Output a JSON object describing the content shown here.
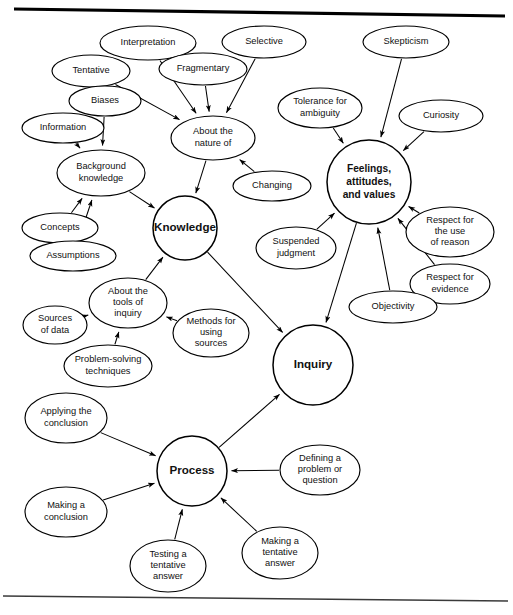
{
  "figure": {
    "kind": "concept-map",
    "title_visible": "",
    "background_color": "#ffffff",
    "line_color": "#000000",
    "text_color": "#111111",
    "width": 513,
    "height": 615,
    "rules": [
      {
        "name": "top-rule",
        "x1": 14,
        "y1": 9,
        "x2": 505,
        "y2": 16,
        "weight": 3.2
      },
      {
        "name": "bottom-rule",
        "x1": 3,
        "y1": 596,
        "x2": 508,
        "y2": 601,
        "weight": 1.3
      }
    ]
  },
  "hubs": [
    {
      "id": "knowledge",
      "label": "Knowledge",
      "cx": 185,
      "cy": 228,
      "r": 32,
      "lines": [
        "Knowledge"
      ]
    },
    {
      "id": "feelings",
      "label": "Feelings, attitudes, and values",
      "cx": 369,
      "cy": 182,
      "r": 42,
      "lines": [
        "Feelings,",
        "attitudes,",
        "and values"
      ]
    },
    {
      "id": "inquiry",
      "label": "Inquiry",
      "cx": 313,
      "cy": 365,
      "r": 40,
      "lines": [
        "Inquiry"
      ]
    },
    {
      "id": "process",
      "label": "Process",
      "cx": 192,
      "cy": 471,
      "r": 35,
      "lines": [
        "Process"
      ]
    }
  ],
  "nodes": [
    {
      "id": "interpretation",
      "label": "Interpretation",
      "cx": 148,
      "cy": 43,
      "rx": 48,
      "ry": 17,
      "lines": [
        "Interpretation"
      ]
    },
    {
      "id": "selective",
      "label": "Selective",
      "cx": 264,
      "cy": 42,
      "rx": 42,
      "ry": 16,
      "lines": [
        "Selective"
      ]
    },
    {
      "id": "skepticism",
      "label": "Skepticism",
      "cx": 406,
      "cy": 42,
      "rx": 43,
      "ry": 16,
      "lines": [
        "Skepticism"
      ]
    },
    {
      "id": "fragmentary",
      "label": "Fragmentary",
      "cx": 203,
      "cy": 69,
      "rx": 44,
      "ry": 16,
      "lines": [
        "Fragmentary"
      ]
    },
    {
      "id": "tentative",
      "label": "Tentative",
      "cx": 91,
      "cy": 71,
      "rx": 39,
      "ry": 16,
      "lines": [
        "Tentative"
      ]
    },
    {
      "id": "tolerance-ambiguity",
      "label": "Tolerance for ambiguity",
      "cx": 320,
      "cy": 108,
      "rx": 42,
      "ry": 20,
      "lines": [
        "Tolerance for",
        "ambiguity"
      ]
    },
    {
      "id": "curiosity",
      "label": "Curiosity",
      "cx": 441,
      "cy": 116,
      "rx": 42,
      "ry": 16,
      "lines": [
        "Curiosity"
      ]
    },
    {
      "id": "biases",
      "label": "Biases",
      "cx": 105,
      "cy": 101,
      "rx": 36,
      "ry": 15,
      "lines": [
        "Biases"
      ]
    },
    {
      "id": "information",
      "label": "Information",
      "cx": 63,
      "cy": 128,
      "rx": 41,
      "ry": 15,
      "lines": [
        "Information"
      ]
    },
    {
      "id": "about-nature-of",
      "label": "About the nature of",
      "cx": 213,
      "cy": 138,
      "rx": 42,
      "ry": 22,
      "lines": [
        "About the",
        "nature of"
      ]
    },
    {
      "id": "background-knowledge",
      "label": "Background knowledge",
      "cx": 101,
      "cy": 173,
      "rx": 44,
      "ry": 23,
      "lines": [
        "Background",
        "knowledge"
      ]
    },
    {
      "id": "changing",
      "label": "Changing",
      "cx": 272,
      "cy": 186,
      "rx": 39,
      "ry": 15,
      "lines": [
        "Changing"
      ]
    },
    {
      "id": "concepts",
      "label": "Concepts",
      "cx": 60,
      "cy": 228,
      "rx": 38,
      "ry": 15,
      "lines": [
        "Concepts"
      ]
    },
    {
      "id": "assumptions",
      "label": "Assumptions",
      "cx": 73,
      "cy": 256,
      "rx": 43,
      "ry": 15,
      "lines": [
        "Assumptions"
      ]
    },
    {
      "id": "suspended-judgment",
      "label": "Suspended judgment",
      "cx": 296,
      "cy": 248,
      "rx": 40,
      "ry": 21,
      "lines": [
        "Suspended",
        "judgment"
      ]
    },
    {
      "id": "respect-reason",
      "label": "Respect for the use of reason",
      "cx": 450,
      "cy": 232,
      "rx": 44,
      "ry": 25,
      "lines": [
        "Respect for",
        "the use",
        "of reason"
      ]
    },
    {
      "id": "respect-evidence",
      "label": "Respect for evidence",
      "cx": 450,
      "cy": 284,
      "rx": 40,
      "ry": 20,
      "lines": [
        "Respect for",
        "evidence"
      ]
    },
    {
      "id": "objectivity",
      "label": "Objectivity",
      "cx": 393,
      "cy": 307,
      "rx": 44,
      "ry": 16,
      "lines": [
        "Objectivity"
      ]
    },
    {
      "id": "about-tools-inquiry",
      "label": "About the tools of inquiry",
      "cx": 128,
      "cy": 303,
      "rx": 39,
      "ry": 25,
      "lines": [
        "About the",
        "tools of",
        "inquiry"
      ]
    },
    {
      "id": "sources-of-data",
      "label": "Sources of data",
      "cx": 55,
      "cy": 325,
      "rx": 32,
      "ry": 19,
      "lines": [
        "Sources",
        "of data"
      ]
    },
    {
      "id": "methods-using-sources",
      "label": "Methods for using sources",
      "cx": 211,
      "cy": 333,
      "rx": 38,
      "ry": 24,
      "lines": [
        "Methods for",
        "using",
        "sources"
      ]
    },
    {
      "id": "problem-solving",
      "label": "Problem-solving techniques",
      "cx": 108,
      "cy": 366,
      "rx": 44,
      "ry": 21,
      "lines": [
        "Problem-solving",
        "techniques"
      ]
    },
    {
      "id": "applying-conclusion",
      "label": "Applying the conclusion",
      "cx": 66,
      "cy": 418,
      "rx": 41,
      "ry": 25,
      "lines": [
        "Applying the",
        "conclusion"
      ]
    },
    {
      "id": "defining-problem",
      "label": "Defining a problem or question",
      "cx": 320,
      "cy": 470,
      "rx": 40,
      "ry": 25,
      "lines": [
        "Defining a",
        "problem or",
        "question"
      ]
    },
    {
      "id": "making-conclusion",
      "label": "Making a conclusion",
      "cx": 66,
      "cy": 512,
      "rx": 41,
      "ry": 25,
      "lines": [
        "Making a",
        "conclusion"
      ]
    },
    {
      "id": "testing-tentative-answer",
      "label": "Testing a tentative answer",
      "cx": 168,
      "cy": 566,
      "rx": 38,
      "ry": 26,
      "lines": [
        "Testing a",
        "tentative",
        "answer"
      ]
    },
    {
      "id": "making-tentative-answer",
      "label": "Making a tentative answer",
      "cx": 280,
      "cy": 553,
      "rx": 38,
      "ry": 26,
      "lines": [
        "Making a",
        "tentative",
        "answer"
      ]
    }
  ],
  "edges": [
    {
      "from": "interpretation",
      "to": "about-nature-of",
      "arrow": true
    },
    {
      "from": "selective",
      "to": "about-nature-of",
      "arrow": true
    },
    {
      "from": "fragmentary",
      "to": "about-nature-of",
      "arrow": true
    },
    {
      "from": "tentative",
      "to": "about-nature-of",
      "arrow": true
    },
    {
      "from": "changing",
      "to": "about-nature-of",
      "arrow": true
    },
    {
      "from": "about-nature-of",
      "to": "knowledge",
      "arrow": true
    },
    {
      "from": "biases",
      "to": "background-knowledge",
      "arrow": true
    },
    {
      "from": "information",
      "to": "background-knowledge",
      "arrow": true
    },
    {
      "from": "concepts",
      "to": "background-knowledge",
      "arrow": true
    },
    {
      "from": "assumptions",
      "to": "background-knowledge",
      "arrow": true
    },
    {
      "from": "background-knowledge",
      "to": "knowledge",
      "arrow": true
    },
    {
      "from": "about-tools-inquiry",
      "to": "knowledge",
      "arrow": true
    },
    {
      "from": "sources-of-data",
      "to": "about-tools-inquiry",
      "arrow": true
    },
    {
      "from": "methods-using-sources",
      "to": "about-tools-inquiry",
      "arrow": true
    },
    {
      "from": "problem-solving",
      "to": "about-tools-inquiry",
      "arrow": true
    },
    {
      "from": "skepticism",
      "to": "feelings",
      "arrow": true
    },
    {
      "from": "tolerance-ambiguity",
      "to": "feelings",
      "arrow": true
    },
    {
      "from": "curiosity",
      "to": "feelings",
      "arrow": true
    },
    {
      "from": "respect-reason",
      "to": "feelings",
      "arrow": true
    },
    {
      "from": "respect-evidence",
      "to": "feelings",
      "arrow": true
    },
    {
      "from": "objectivity",
      "to": "feelings",
      "arrow": true
    },
    {
      "from": "suspended-judgment",
      "to": "feelings",
      "arrow": true
    },
    {
      "from": "knowledge",
      "to": "inquiry",
      "arrow": true
    },
    {
      "from": "feelings",
      "to": "inquiry",
      "arrow": true
    },
    {
      "from": "process",
      "to": "inquiry",
      "arrow": true
    },
    {
      "from": "applying-conclusion",
      "to": "process",
      "arrow": true
    },
    {
      "from": "making-conclusion",
      "to": "process",
      "arrow": true
    },
    {
      "from": "testing-tentative-answer",
      "to": "process",
      "arrow": true
    },
    {
      "from": "making-tentative-answer",
      "to": "process",
      "arrow": true
    },
    {
      "from": "defining-problem",
      "to": "process",
      "arrow": true
    }
  ]
}
